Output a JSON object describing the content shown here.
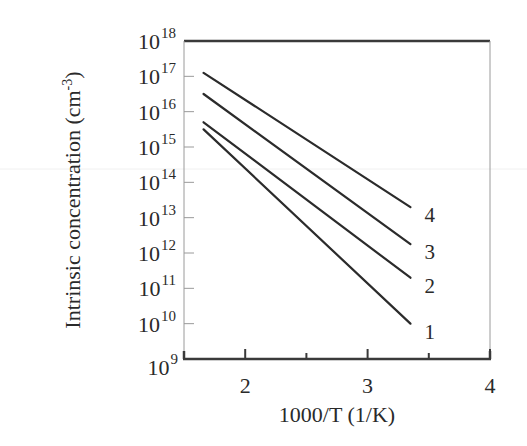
{
  "chart_data": {
    "type": "line",
    "title": "",
    "xlabel": "1000/T (1/K)",
    "ylabel": "Intrinsic concentration (cm^-3)",
    "ylabel_parts": {
      "main": "Intrinsic concentration (cm",
      "sup": "-3",
      "close": ")"
    },
    "yscale": "log",
    "xlim": [
      1.5,
      4
    ],
    "ylim": [
      1000000000.0,
      1e+18
    ],
    "x_ticks": [
      2,
      3,
      4
    ],
    "x_tick_labels": [
      "2",
      "3",
      "4"
    ],
    "x_minor_ticks": [
      2.5,
      3.5
    ],
    "y_ticks_exponent": [
      18,
      17,
      16,
      15,
      14,
      13,
      12,
      11,
      10,
      9
    ],
    "y_tick_labels": [
      "10^18",
      "10^17",
      "10^16",
      "10^15",
      "10^14",
      "10^13",
      "10^12",
      "10^11",
      "10^10",
      "10^9"
    ],
    "grid": false,
    "legend": "inline labels at line ends",
    "series": [
      {
        "name": "1",
        "x": [
          1.66,
          3.35
        ],
        "log10_y": [
          15.5,
          10.0
        ]
      },
      {
        "name": "2",
        "x": [
          1.66,
          3.35
        ],
        "log10_y": [
          15.7,
          11.3
        ]
      },
      {
        "name": "3",
        "x": [
          1.66,
          3.35
        ],
        "log10_y": [
          16.5,
          12.25
        ]
      },
      {
        "name": "4",
        "x": [
          1.66,
          3.35
        ],
        "log10_y": [
          17.1,
          13.3
        ]
      }
    ]
  },
  "colors": {
    "axis": "#3a3a3a",
    "line": "#2b2b2b",
    "frame": "#9a9a9a"
  }
}
